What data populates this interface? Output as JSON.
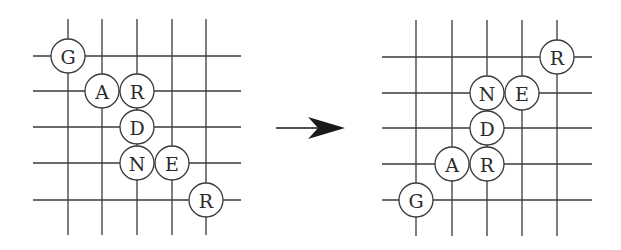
{
  "diagram": {
    "type": "grid-word-transformation",
    "colors": {
      "line": "#3a3a3a",
      "circle_fill": "#ffffff",
      "text": "#2a2a2a",
      "arrow": "#1a1a1a"
    },
    "left_grid": {
      "x_lines": [
        68,
        102,
        137,
        172,
        206
      ],
      "y_lines": [
        56,
        91,
        127,
        163,
        200
      ],
      "x_extent": [
        33,
        241
      ],
      "y_extent": [
        19,
        235
      ],
      "nodes": [
        {
          "letter": "G",
          "col": 0,
          "row": 0
        },
        {
          "letter": "A",
          "col": 1,
          "row": 1
        },
        {
          "letter": "R",
          "col": 2,
          "row": 1
        },
        {
          "letter": "D",
          "col": 2,
          "row": 2
        },
        {
          "letter": "N",
          "col": 2,
          "row": 3
        },
        {
          "letter": "E",
          "col": 3,
          "row": 3
        },
        {
          "letter": "R",
          "col": 4,
          "row": 4
        }
      ]
    },
    "arrow": {
      "from": [
        276,
        128
      ],
      "to": [
        345,
        128
      ],
      "direction": "right"
    },
    "right_grid": {
      "x_lines": [
        416,
        452,
        487,
        522,
        557
      ],
      "y_lines": [
        57,
        93,
        128,
        164,
        200
      ],
      "x_extent": [
        382,
        592
      ],
      "y_extent": [
        20,
        236
      ],
      "nodes": [
        {
          "letter": "R",
          "col": 4,
          "row": 0
        },
        {
          "letter": "N",
          "col": 2,
          "row": 1
        },
        {
          "letter": "E",
          "col": 3,
          "row": 1
        },
        {
          "letter": "D",
          "col": 2,
          "row": 2
        },
        {
          "letter": "A",
          "col": 1,
          "row": 3
        },
        {
          "letter": "R",
          "col": 2,
          "row": 3
        },
        {
          "letter": "G",
          "col": 0,
          "row": 4
        }
      ]
    },
    "node_radius": 17
  }
}
